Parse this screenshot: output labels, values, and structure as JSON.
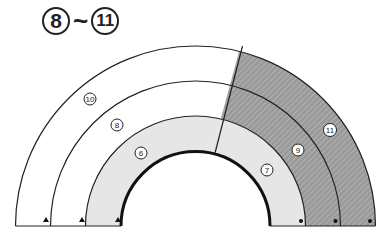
{
  "title": {
    "start": "8",
    "separator": "~",
    "end": "11"
  },
  "diagram": {
    "type": "concentric semicircular bands",
    "colors": {
      "line": "#222222",
      "gray_band": "#e6e6e6",
      "hatched": "#9a9a9a",
      "hatch_stripe": "#d6d6d6"
    },
    "regions": [
      {
        "label": "6",
        "side": "left",
        "fill": "gray"
      },
      {
        "label": "7",
        "side": "right",
        "fill": "gray"
      },
      {
        "label": "8",
        "side": "left",
        "fill": "white"
      },
      {
        "label": "9",
        "side": "right",
        "fill": "hatched"
      },
      {
        "label": "10",
        "side": "left",
        "fill": "white"
      },
      {
        "label": "11",
        "side": "right",
        "fill": "hatched"
      }
    ],
    "markers": {
      "left": "triangle",
      "right": "dot"
    }
  }
}
